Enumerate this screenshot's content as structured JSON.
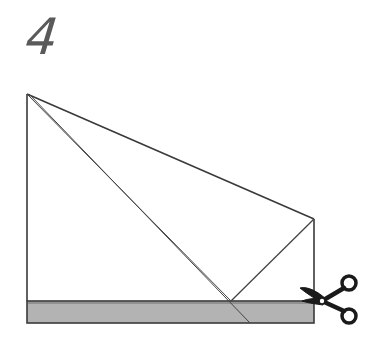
{
  "step": {
    "number": "4"
  },
  "diagram": {
    "colors": {
      "line": "#3a3a3a",
      "strip_fill": "#b3b3b3",
      "scissors": "#1a1a1a",
      "paper": "#ffffff"
    },
    "points": {
      "top_left": [
        27,
        94
      ],
      "right_peak": [
        314,
        219
      ],
      "fold_apex": [
        231,
        301
      ],
      "strip_top_left": [
        27,
        301
      ],
      "strip_bottom_right": [
        314,
        323
      ],
      "diagonal_end": [
        250,
        323
      ]
    },
    "icons": [
      "scissors-icon"
    ]
  }
}
